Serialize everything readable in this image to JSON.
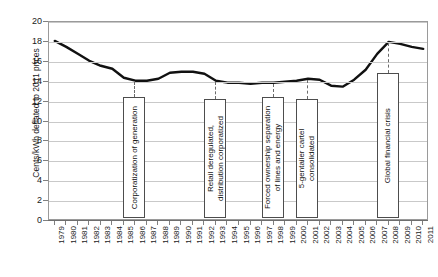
{
  "chart_data": {
    "type": "line",
    "title": "",
    "subtitle": "",
    "xlabel": "",
    "ylabel": "Cents/kWh deflated to 2011 prices",
    "ylim": [
      0,
      20
    ],
    "ytick_step": 2,
    "yticks": [
      0,
      2,
      4,
      6,
      8,
      10,
      12,
      14,
      16,
      18,
      20
    ],
    "grid": true,
    "legend_position": "none",
    "series_color": "#111111",
    "categories": [
      "1979",
      "1980",
      "1981",
      "1982",
      "1983",
      "1984",
      "1985",
      "1986",
      "1987",
      "1988",
      "1989",
      "1990",
      "1991",
      "1992",
      "1993",
      "1994",
      "1995",
      "1996",
      "1997",
      "1998",
      "1999",
      "2000",
      "2001",
      "2002",
      "2003",
      "2004",
      "2005",
      "2006",
      "2007",
      "2008",
      "2009",
      "2010",
      "2011"
    ],
    "series": [
      {
        "name": "Residential electricity price",
        "values": [
          18.1,
          17.5,
          16.8,
          16.1,
          15.6,
          15.3,
          14.4,
          14.1,
          14.1,
          14.3,
          14.9,
          15.0,
          15.0,
          14.8,
          14.1,
          13.9,
          13.9,
          13.8,
          13.9,
          13.9,
          14.0,
          14.1,
          14.3,
          14.2,
          13.6,
          13.5,
          14.2,
          15.2,
          16.8,
          18.0,
          17.8,
          17.5,
          17.3
        ]
      }
    ],
    "annotations": [
      {
        "id": "corporatization-of-generation",
        "label": "Corporatization of generation",
        "year": "1986",
        "top_value": 12.4,
        "bottom_value": 0.2
      },
      {
        "id": "retail-deregulated",
        "label": "Retail deregulated,\ndistribution corporatized",
        "label_line1": "Retail deregulated,",
        "label_line2": "distribution corporatized",
        "year": "1993",
        "top_value": 12.2,
        "bottom_value": 0.2
      },
      {
        "id": "forced-ownership-separation",
        "label": "Forced ownership separation\nof lines and energy",
        "label_line1": "Forced ownership separation",
        "label_line2": "of lines and energy",
        "year": "1998",
        "top_value": 12.4,
        "bottom_value": 0.2
      },
      {
        "id": "gentailer-cartel-consolidated",
        "label": "5-gentailer cartel\nconsolidated",
        "label_line1": "5-gentailer cartel",
        "label_line2": "consolidated",
        "year": "2001",
        "top_value": 12.2,
        "bottom_value": 0.2
      },
      {
        "id": "global-financial-crisis",
        "label": "Global financial crisis",
        "year": "2008",
        "top_value": 14.8,
        "bottom_value": 0.2
      }
    ]
  }
}
